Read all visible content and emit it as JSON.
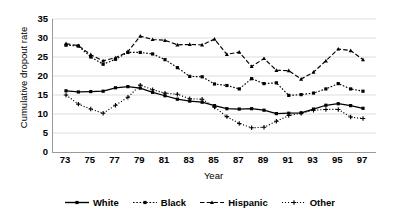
{
  "chart_data": {
    "type": "line",
    "title": "",
    "xlabel": "Year",
    "ylabel": "Cumulative dropout rate",
    "xlim": [
      73,
      97
    ],
    "ylim": [
      0,
      35
    ],
    "ytick_step": 5,
    "yticks": [
      0,
      5,
      10,
      15,
      20,
      25,
      30,
      35
    ],
    "xticks": [
      73,
      75,
      77,
      79,
      81,
      83,
      85,
      87,
      89,
      91,
      93,
      95,
      97
    ],
    "x": [
      73,
      74,
      75,
      76,
      77,
      78,
      79,
      80,
      81,
      82,
      83,
      84,
      85,
      86,
      87,
      88,
      89,
      90,
      91,
      92,
      93,
      94,
      95,
      96,
      97
    ],
    "grid": "horizontal",
    "legend_position": "bottom",
    "series": [
      {
        "name": "White",
        "style": "solid",
        "marker": "square",
        "color": "#000000",
        "values": [
          16.1,
          15.8,
          15.9,
          16.0,
          16.9,
          17.2,
          16.8,
          15.7,
          14.8,
          13.9,
          13.4,
          13.1,
          12.2,
          11.4,
          11.3,
          11.4,
          11.0,
          10.1,
          10.2,
          10.3,
          11.3,
          12.3,
          12.7,
          12.2,
          11.5
        ]
      },
      {
        "name": "Black",
        "style": "dotted",
        "marker": "square",
        "color": "#000000",
        "values": [
          28.1,
          27.9,
          25.0,
          23.1,
          24.4,
          26.2,
          26.2,
          25.8,
          24.3,
          22.2,
          19.9,
          19.8,
          17.9,
          17.5,
          16.6,
          19.3,
          18.0,
          18.2,
          14.9,
          15.1,
          15.5,
          16.6,
          18.0,
          16.6,
          16.0
        ]
      },
      {
        "name": "Hispanic",
        "style": "dashed",
        "marker": "triangle",
        "color": "#000000",
        "values": [
          28.5,
          28.0,
          25.6,
          24.0,
          24.8,
          26.4,
          30.5,
          29.6,
          29.4,
          28.2,
          28.3,
          28.2,
          29.7,
          25.7,
          26.3,
          22.5,
          24.6,
          21.5,
          21.4,
          19.2,
          21.0,
          24.0,
          27.1,
          26.7,
          24.3
        ]
      },
      {
        "name": "Other",
        "style": "fine-dotted",
        "marker": "plus",
        "color": "#000000",
        "values": [
          15.0,
          12.6,
          11.3,
          10.2,
          12.3,
          14.4,
          17.6,
          16.4,
          15.5,
          15.2,
          14.0,
          13.9,
          11.8,
          9.3,
          7.5,
          6.4,
          6.5,
          8.1,
          9.6,
          10.2,
          11.0,
          11.2,
          11.2,
          9.2,
          8.8
        ]
      }
    ]
  },
  "legend": {
    "items": [
      {
        "label": "White"
      },
      {
        "label": "Black"
      },
      {
        "label": "Hispanic"
      },
      {
        "label": "Other"
      }
    ]
  },
  "axes": {
    "y_title": "Cumulative dropout rate",
    "x_title": "Year"
  }
}
